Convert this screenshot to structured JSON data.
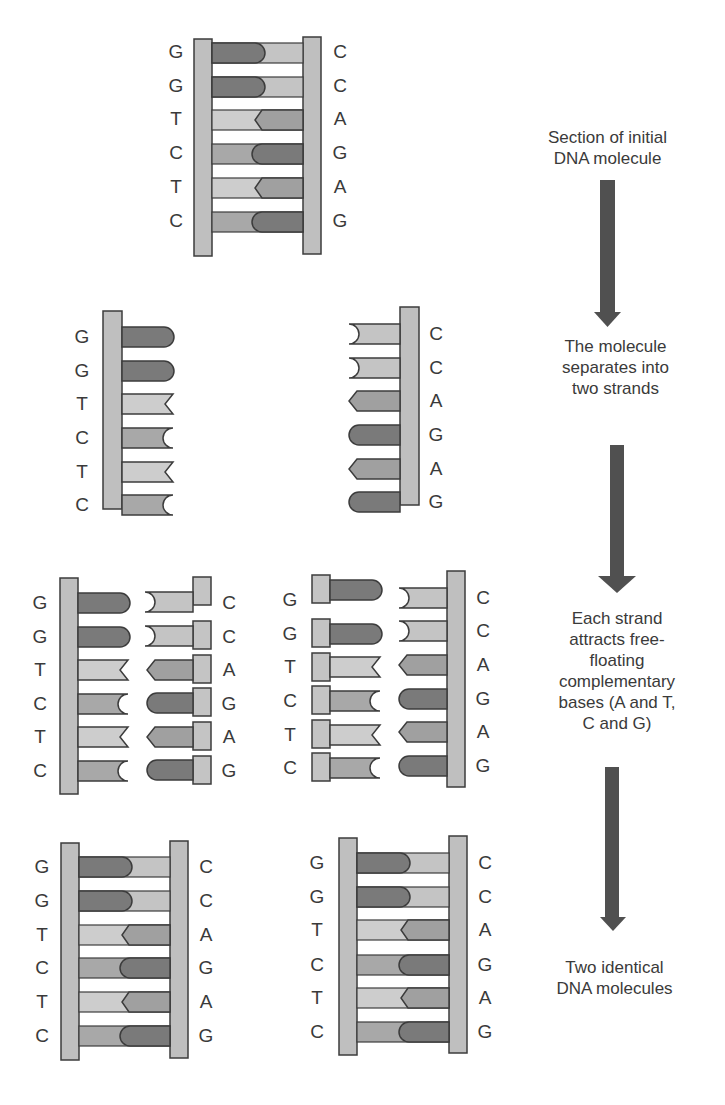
{
  "colors": {
    "backbone": "#bfbfbf",
    "outline": "#3c3c3c",
    "dark_base": "#7a7a7a",
    "mid_base": "#a8a8a8",
    "light_base": "#cdcdcd",
    "arrow": "#505050",
    "text": "#3a3a3a"
  },
  "sequence": {
    "left_strand": [
      "G",
      "G",
      "T",
      "C",
      "T",
      "C"
    ],
    "right_strand": [
      "C",
      "C",
      "A",
      "G",
      "A",
      "G"
    ]
  },
  "stages": [
    {
      "id": "initial",
      "caption": "Section of initial\nDNA molecule"
    },
    {
      "id": "separated",
      "caption": "The molecule\nseparates into\ntwo strands"
    },
    {
      "id": "attracting",
      "caption": "Each strand\nattracts free-\nfloating\ncomplementary\nbases (A and T,\nC and G)"
    },
    {
      "id": "final",
      "caption": "Two identical\nDNA molecules"
    }
  ],
  "labels": {
    "initial_left": [
      "G",
      "G",
      "T",
      "C",
      "T",
      "C"
    ],
    "initial_right": [
      "C",
      "C",
      "A",
      "G",
      "A",
      "G"
    ],
    "sep_left": [
      "G",
      "G",
      "T",
      "C",
      "T",
      "C"
    ],
    "sep_right": [
      "C",
      "C",
      "A",
      "G",
      "A",
      "G"
    ],
    "att1_left": [
      "G",
      "G",
      "T",
      "C",
      "T",
      "C"
    ],
    "att1_right": [
      "C",
      "C",
      "A",
      "G",
      "A",
      "G"
    ],
    "att2_left": [
      "G",
      "G",
      "T",
      "C",
      "T",
      "C"
    ],
    "att2_right": [
      "C",
      "C",
      "A",
      "G",
      "A",
      "G"
    ],
    "final1_left": [
      "G",
      "G",
      "T",
      "C",
      "T",
      "C"
    ],
    "final1_right": [
      "C",
      "C",
      "A",
      "G",
      "A",
      "G"
    ],
    "final2_left": [
      "G",
      "G",
      "T",
      "C",
      "T",
      "C"
    ],
    "final2_right": [
      "C",
      "C",
      "A",
      "G",
      "A",
      "G"
    ]
  }
}
